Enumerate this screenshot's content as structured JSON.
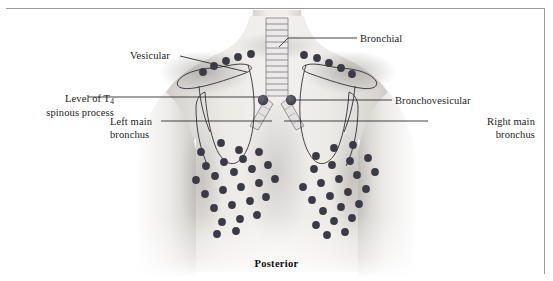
{
  "figure": {
    "orientation_label": "Posterior",
    "border_color": "#9a9a9a",
    "background": "#ffffff"
  },
  "labels": {
    "vesicular": "Vesicular",
    "bronchial": "Bronchial",
    "bronchovesicular": "Bronchovesicular",
    "t4_line1": "Level of T",
    "t4_sub": "4",
    "t4_line2": "spinous process",
    "left_main_line1": "Left main",
    "left_main_line2": "bronchus",
    "right_main_line1": "Right main",
    "right_main_line2": "bronchus"
  },
  "colors": {
    "dot": "#3b3b45",
    "leader_line": "#2b2b2b",
    "outline": "#2f2f35",
    "skin_light": "#f2f0ee",
    "skin_mid": "#cfccc8",
    "skin_shadow": "#a9a6a3",
    "text": "#1c1c1c"
  },
  "anatomy": {
    "structures": [
      "torso-posterior",
      "neck",
      "left-arm",
      "right-arm",
      "trachea",
      "tracheal-cartilage-rings",
      "carina",
      "left-main-bronchus",
      "right-main-bronchus",
      "left-scapula",
      "right-scapula",
      "lung-field-outline"
    ],
    "tracheal_ring_count": 13
  },
  "auscultation_dots": {
    "radius": 3.9,
    "shoulder_left": [
      [
        203,
        72
      ],
      [
        213,
        66
      ],
      [
        224,
        60
      ],
      [
        236,
        56
      ],
      [
        248,
        53
      ]
    ],
    "shoulder_right": [
      [
        305,
        55
      ],
      [
        317,
        58
      ],
      [
        329,
        62
      ],
      [
        341,
        67
      ],
      [
        352,
        73
      ]
    ],
    "carina_left": [
      [
        262,
        101
      ]
    ],
    "carina_right": [
      [
        291,
        101
      ]
    ],
    "back_left": [
      [
        201,
        152
      ],
      [
        221,
        143
      ],
      [
        238,
        150
      ],
      [
        206,
        166
      ],
      [
        224,
        162
      ],
      [
        243,
        159
      ],
      [
        258,
        152
      ],
      [
        196,
        180
      ],
      [
        215,
        176
      ],
      [
        234,
        172
      ],
      [
        252,
        169
      ],
      [
        268,
        165
      ],
      [
        205,
        194
      ],
      [
        223,
        190
      ],
      [
        241,
        187
      ],
      [
        259,
        183
      ],
      [
        275,
        179
      ],
      [
        214,
        208
      ],
      [
        232,
        205
      ],
      [
        250,
        201
      ],
      [
        266,
        197
      ],
      [
        222,
        222
      ],
      [
        240,
        219
      ],
      [
        257,
        215
      ],
      [
        217,
        233
      ],
      [
        236,
        231
      ]
    ],
    "back_right": [
      [
        353,
        145
      ],
      [
        334,
        148
      ],
      [
        316,
        155
      ],
      [
        368,
        158
      ],
      [
        350,
        161
      ],
      [
        332,
        165
      ],
      [
        314,
        169
      ],
      [
        375,
        172
      ],
      [
        357,
        175
      ],
      [
        339,
        179
      ],
      [
        321,
        183
      ],
      [
        303,
        186
      ],
      [
        366,
        189
      ],
      [
        348,
        192
      ],
      [
        330,
        196
      ],
      [
        312,
        200
      ],
      [
        359,
        203
      ],
      [
        341,
        207
      ],
      [
        323,
        211
      ],
      [
        352,
        218
      ],
      [
        334,
        221
      ],
      [
        316,
        224
      ],
      [
        345,
        232
      ],
      [
        327,
        234
      ]
    ]
  },
  "leader_lines": [
    {
      "name": "vesicular",
      "from": [
        180,
        56
      ],
      "to": [
        247,
        72
      ]
    },
    {
      "name": "bronchial",
      "from": [
        357,
        38
      ],
      "to": [
        287,
        38
      ],
      "elbow": [
        287,
        38
      ],
      "end": [
        279,
        45
      ]
    },
    {
      "name": "t4",
      "from": [
        88,
        97
      ],
      "to": [
        262,
        97
      ]
    },
    {
      "name": "left-main",
      "from": [
        161,
        121
      ],
      "to": [
        272,
        121
      ]
    },
    {
      "name": "bronchovesicular",
      "from": [
        392,
        100
      ],
      "to": [
        293,
        100
      ]
    },
    {
      "name": "right-main",
      "from": [
        428,
        121
      ],
      "to": [
        283,
        121
      ]
    }
  ]
}
